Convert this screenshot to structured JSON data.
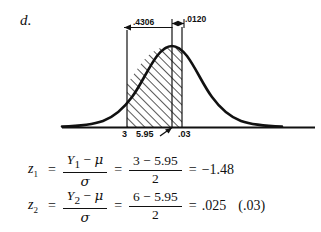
{
  "part": {
    "label": "d."
  },
  "figure": {
    "type": "normal-distribution-curve",
    "dimension_labels": [
      {
        "name": "left-area",
        "text": ".4306"
      },
      {
        "name": "right-area",
        "text": ".0120"
      }
    ],
    "axis_labels": [
      {
        "name": "lower-bound",
        "text": "3"
      },
      {
        "name": "mean",
        "text": "5.95"
      },
      {
        "name": "upper-bound",
        "text": ".03"
      }
    ],
    "colors": {
      "curve": "#111111",
      "axis": "#111111",
      "hatch": "#111111",
      "background": "#ffffff"
    }
  },
  "equations": [
    {
      "name": "z1",
      "lhs_var": "z",
      "lhs_sub": "1",
      "eq1": "=",
      "frac1_num_var": "Y",
      "frac1_num_sub": "1",
      "frac1_num_minus": "−",
      "frac1_num_mu": "μ",
      "frac1_den": "σ",
      "eq2": "=",
      "frac2_num": "3 − 5.95",
      "frac2_den": "2",
      "eq3": "=",
      "result": "−1.48",
      "note": ""
    },
    {
      "name": "z2",
      "lhs_var": "z",
      "lhs_sub": "2",
      "eq1": "=",
      "frac1_num_var": "Y",
      "frac1_num_sub": "2",
      "frac1_num_minus": "−",
      "frac1_num_mu": "μ",
      "frac1_den": "σ",
      "eq2": "=",
      "frac2_num": "6 − 5.95",
      "frac2_den": "2",
      "eq3": "=",
      "result": ".025",
      "note": "(.03)"
    }
  ]
}
